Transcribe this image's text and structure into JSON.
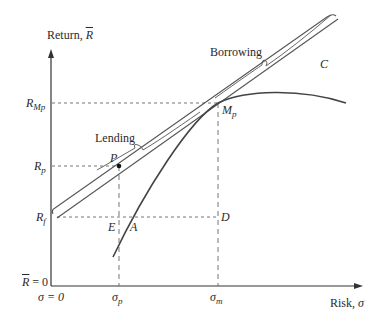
{
  "diagram": {
    "type": "capital-market-line",
    "colors": {
      "axis": "#333333",
      "line": "#555555",
      "curve": "#444444",
      "dash": "#666666",
      "text": "#2a2a2a"
    },
    "axes": {
      "y_label": "Return, ",
      "y_label_symbol": "R",
      "x_label": "Risk, ",
      "x_label_symbol": "σ",
      "y_origin_label_symbol": "R",
      "y_origin_label_rest": " = 0",
      "x_origin_label": "σ = 0"
    },
    "y_ticks": [
      {
        "symbol": "R",
        "sub": "Mp"
      },
      {
        "symbol": "R",
        "sub": "p"
      },
      {
        "symbol": "R",
        "sub": "f"
      }
    ],
    "x_ticks": [
      {
        "symbol": "σ",
        "sub": "p"
      },
      {
        "symbol": "σ",
        "sub": "m"
      }
    ],
    "points": {
      "P": "P",
      "M": "M",
      "M_sub": "p",
      "E": "E",
      "A": "A",
      "D": "D",
      "C": "C"
    },
    "annotations": {
      "lending": "Lending",
      "borrowing": "Borrowing"
    }
  }
}
